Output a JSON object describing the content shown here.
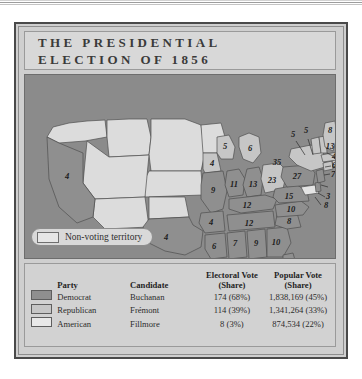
{
  "title": {
    "line1": "THE PRESIDENTIAL",
    "line2": "ELECTION OF 1856"
  },
  "map": {
    "legend": {
      "swatch_name": "non-voting-territory-swatch",
      "label": "Non-voting territory"
    },
    "colors": {
      "democrat": "#8f8f8f",
      "republican": "#c6c6c6",
      "american": "#e4e4e4",
      "nonvoting": "#dcdcdc",
      "ocean": "#8b8b8b",
      "border": "#4f4f4f"
    },
    "state_labels": [
      {
        "state": "California",
        "value": "4",
        "party": "democrat",
        "x": 42,
        "y": 101
      },
      {
        "state": "Texas",
        "value": "4",
        "party": "democrat",
        "x": 136,
        "y": 162
      },
      {
        "state": "Iowa",
        "value": "4",
        "party": "republican",
        "x": 189,
        "y": 103
      },
      {
        "state": "Missouri",
        "value": "9",
        "party": "democrat",
        "x": 200,
        "y": 125
      },
      {
        "state": "Arkansas",
        "value": "4",
        "party": "democrat",
        "x": 188,
        "y": 150
      },
      {
        "state": "Louisiana",
        "value": "6",
        "party": "democrat",
        "x": 194,
        "y": 175
      },
      {
        "state": "Mississippi",
        "value": "7",
        "party": "democrat",
        "x": 210,
        "y": 167
      },
      {
        "state": "Alabama",
        "value": "9",
        "party": "democrat",
        "x": 227,
        "y": 167
      },
      {
        "state": "Georgia",
        "value": "10",
        "party": "democrat",
        "x": 246,
        "y": 167
      },
      {
        "state": "Florida",
        "value": "3",
        "party": "democrat",
        "x": 268,
        "y": 190
      },
      {
        "state": "Tennessee",
        "value": "12",
        "party": "democrat",
        "x": 222,
        "y": 147
      },
      {
        "state": "Kentucky",
        "value": "12",
        "party": "democrat",
        "x": 224,
        "y": 132
      },
      {
        "state": "South Carolina",
        "value": "8",
        "party": "democrat",
        "x": 258,
        "y": 152
      },
      {
        "state": "North Carolina",
        "value": "10",
        "party": "democrat",
        "x": 259,
        "y": 138
      },
      {
        "state": "Virginia",
        "value": "15",
        "party": "democrat",
        "x": 262,
        "y": 121
      },
      {
        "state": "Illinois",
        "value": "11",
        "party": "democrat",
        "x": 213,
        "y": 107
      },
      {
        "state": "Indiana",
        "value": "13",
        "party": "democrat",
        "x": 230,
        "y": 110
      },
      {
        "state": "Ohio",
        "value": "23",
        "party": "republican",
        "x": 246,
        "y": 107
      },
      {
        "state": "Wisconsin",
        "value": "5",
        "party": "republican",
        "x": 204,
        "y": 86
      },
      {
        "state": "Michigan",
        "value": "6",
        "party": "republican",
        "x": 227,
        "y": 91
      },
      {
        "state": "Pennsylvania",
        "value": "27",
        "party": "democrat",
        "x": 272,
        "y": 104
      },
      {
        "state": "New York",
        "value": "35",
        "party": "republican",
        "x": 288,
        "y": 93
      },
      {
        "state": "Maryland",
        "value": "8",
        "party": "american",
        "x": 283,
        "y": 132
      },
      {
        "state": "Delaware",
        "value": "3",
        "party": "democrat",
        "x": 285,
        "y": 122
      },
      {
        "state": "New Jersey",
        "value": "7",
        "party": "democrat",
        "x": 297,
        "y": 115
      },
      {
        "state": "Connecticut",
        "value": "6",
        "party": "republican",
        "x": 302,
        "y": 107
      },
      {
        "state": "Rhode Island",
        "value": "4",
        "party": "republican",
        "x": 302,
        "y": 98
      },
      {
        "state": "Massachusetts",
        "value": "13",
        "party": "republican",
        "x": 312,
        "y": 89
      },
      {
        "state": "Vermont",
        "value": "5",
        "party": "republican",
        "x": 277,
        "y": 72
      },
      {
        "state": "New Hampshire",
        "value": "5",
        "party": "republican",
        "x": 288,
        "y": 70
      },
      {
        "state": "Maine",
        "value": "8",
        "party": "republican",
        "x": 305,
        "y": 71
      }
    ]
  },
  "table": {
    "headers": {
      "swatch": "",
      "party": "Party",
      "candidate": "Candidate",
      "electoral_line1": "Electoral Vote",
      "electoral_line2": "(Share)",
      "popular_line1": "Popular Vote",
      "popular_line2": "(Share)"
    },
    "rows": [
      {
        "swatch_color": "#8f8f8f",
        "party": "Democrat",
        "candidate": "Buchanan",
        "electoral": "174 (68%)",
        "popular": "1,838,169 (45%)"
      },
      {
        "swatch_color": "#c6c6c6",
        "party": "Republican",
        "candidate": "Frémont",
        "electoral": "114 (39%)",
        "popular": "1,341,264 (33%)"
      },
      {
        "swatch_color": "#e8e8e8",
        "party": "American",
        "candidate": "Fillmore",
        "electoral": "8 (3%)",
        "popular": "874,534 (22%)"
      }
    ]
  }
}
